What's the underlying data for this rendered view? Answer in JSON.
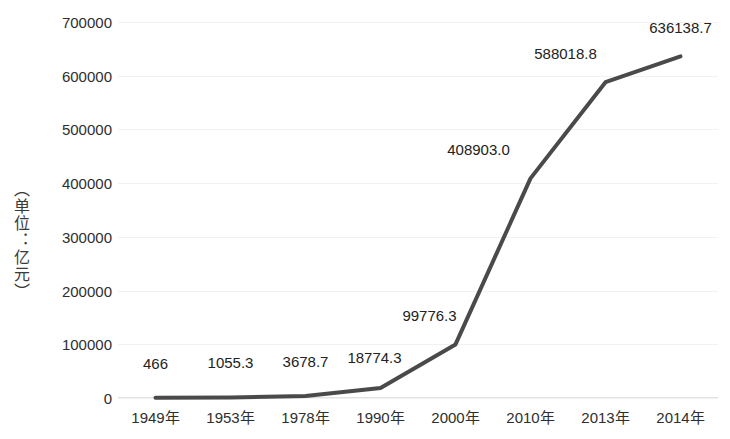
{
  "chart_data": {
    "type": "line",
    "title": "",
    "subtitle": "",
    "xlabel": "",
    "ylabel": "（单位：亿元）",
    "categories": [
      "1949年",
      "1953年",
      "1978年",
      "1990年",
      "2000年",
      "2010年",
      "2013年",
      "2014年"
    ],
    "values": [
      466,
      1055.3,
      3678.7,
      18774.3,
      99776.3,
      408903.0,
      588018.8,
      636138.7
    ],
    "point_labels": [
      "466",
      "1055.3",
      "3678.7",
      "18774.3",
      "99776.3",
      "408903.0",
      "588018.8",
      "636138.7"
    ],
    "series": [
      {
        "name": "",
        "values": [
          466,
          1055.3,
          3678.7,
          18774.3,
          99776.3,
          408903.0,
          588018.8,
          636138.7
        ]
      }
    ],
    "y_ticks": [
      0,
      100000,
      200000,
      300000,
      400000,
      500000,
      600000,
      700000
    ],
    "y_tick_labels": [
      "0",
      "100000",
      "200000",
      "300000",
      "400000",
      "500000",
      "600000",
      "700000"
    ],
    "ylim": [
      0,
      700000
    ],
    "grid": true,
    "legend": false,
    "legend_position": "none",
    "line_color": "#4a4a4a",
    "gridline_color": "#f1f1f1",
    "text_color": "#2e2e2e"
  }
}
